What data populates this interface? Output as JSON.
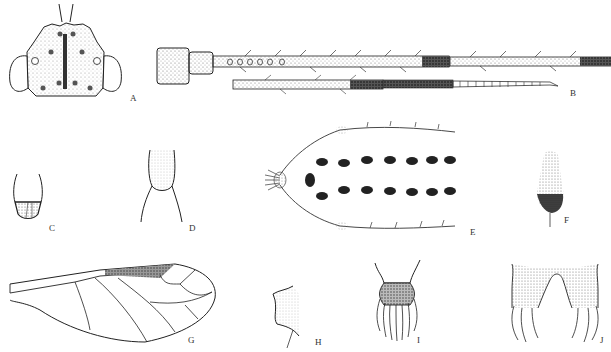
{
  "figure": {
    "type": "entomological illustration plate",
    "panels": [
      {
        "id": "A",
        "label": "A",
        "subject": "head capsule, dorsal view"
      },
      {
        "id": "B",
        "label": "B",
        "subject": "antennae"
      },
      {
        "id": "C",
        "label": "C",
        "subject": "segment detail"
      },
      {
        "id": "D",
        "label": "D",
        "subject": "segment detail"
      },
      {
        "id": "E",
        "label": "E",
        "subject": "body with setal tubercles, dorsal view"
      },
      {
        "id": "F",
        "label": "F",
        "subject": "appendage"
      },
      {
        "id": "G",
        "label": "G",
        "subject": "forewing"
      },
      {
        "id": "H",
        "label": "H",
        "subject": "process detail"
      },
      {
        "id": "I",
        "label": "I",
        "subject": "terminal segment with setae"
      },
      {
        "id": "J",
        "label": "J",
        "subject": "paired terminal lobes with setae"
      }
    ]
  },
  "colors": {
    "ink": "#222222",
    "stipple": "#555555",
    "dark": "#1a1a1a",
    "background": "#ffffff"
  }
}
